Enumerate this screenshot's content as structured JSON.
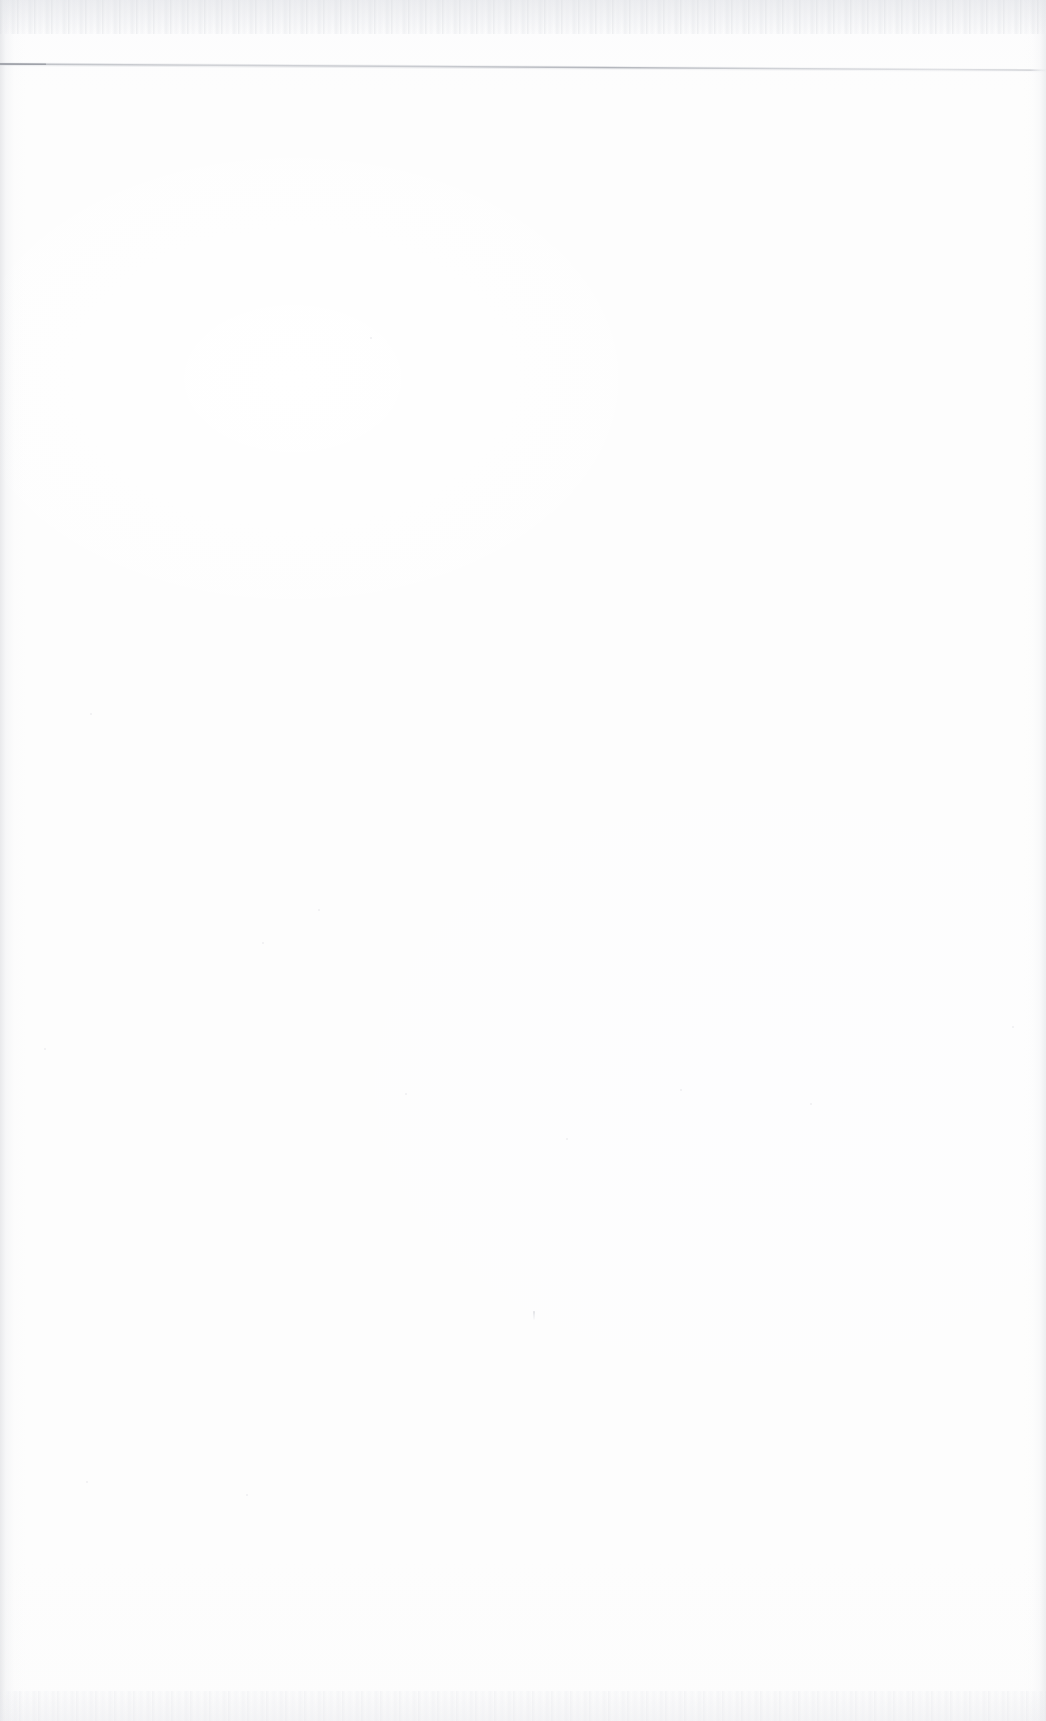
{
  "document": {
    "kind": "scanned-blank-page",
    "page_label": "",
    "body_text": "",
    "background_color": "#fdfdfd",
    "page_width_px": 1046,
    "page_height_px": 1721
  },
  "rule": {
    "name": "horizontal-rule",
    "color": "#c9cbd0",
    "left_x": 0,
    "left_y": 16,
    "right_x": 1046,
    "right_y": 22,
    "thickness_px": 1.6,
    "description": ""
  },
  "artifacts": {
    "dust_speck_label": "",
    "top_noise_label": "",
    "bottom_noise_label": "",
    "left_shadow_label": "",
    "right_shadow_label": ""
  },
  "specks": [
    {
      "x": 262,
      "y": 942
    },
    {
      "x": 318,
      "y": 909
    },
    {
      "x": 44,
      "y": 1048
    },
    {
      "x": 405,
      "y": 1093
    },
    {
      "x": 810,
      "y": 1103
    },
    {
      "x": 1012,
      "y": 1026
    },
    {
      "x": 86,
      "y": 1481
    },
    {
      "x": 246,
      "y": 1494
    },
    {
      "x": 680,
      "y": 1089
    },
    {
      "x": 566,
      "y": 1138
    },
    {
      "x": 90,
      "y": 713
    },
    {
      "x": 370,
      "y": 337
    },
    {
      "x": 1046,
      "y": 418
    }
  ]
}
